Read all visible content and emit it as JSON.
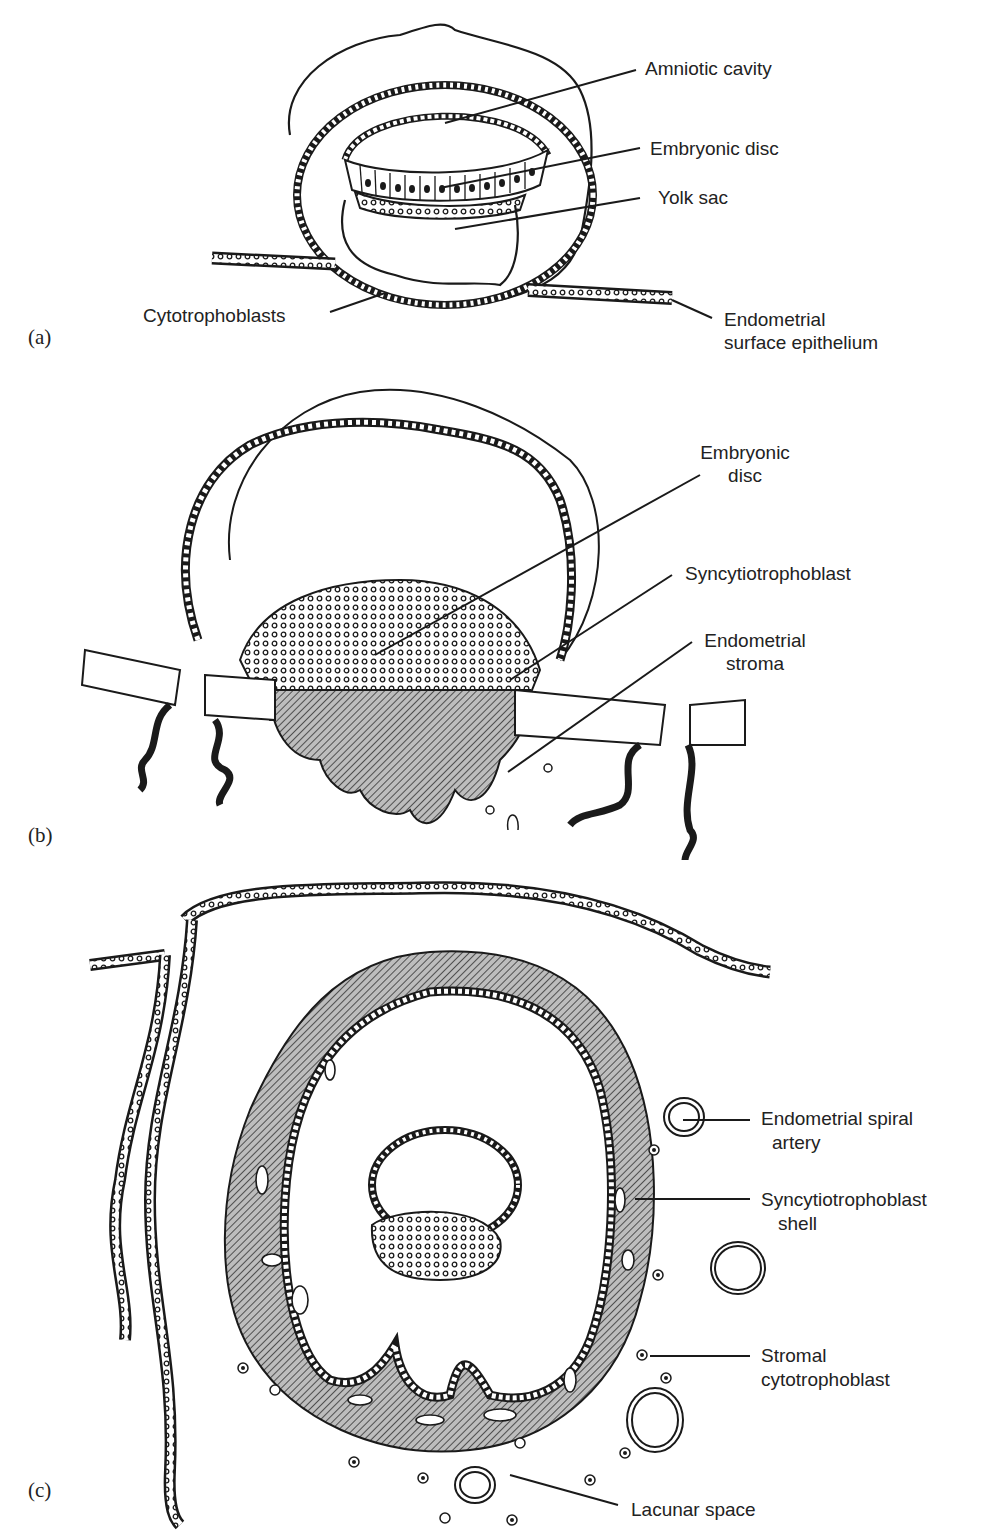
{
  "panels": [
    {
      "id": "a",
      "panel_label": "(a)",
      "labels": {
        "amniotic_cavity": "Amniotic cavity",
        "embryonic_disc": "Embryonic disc",
        "yolk_sac": "Yolk sac",
        "cytotrophoblasts": "Cytotrophoblasts",
        "endometrial_surface_epithelium_1": "Endometrial",
        "endometrial_surface_epithelium_2": "surface epithelium"
      }
    },
    {
      "id": "b",
      "panel_label": "(b)",
      "labels": {
        "embryonic_disc_1": "Embryonic",
        "embryonic_disc_2": "disc",
        "syncytiotrophoblast": "Syncytiotrophoblast",
        "endometrial_stroma_1": "Endometrial",
        "endometrial_stroma_2": "stroma"
      }
    },
    {
      "id": "c",
      "panel_label": "(c)",
      "labels": {
        "spiral_artery_1": "Endometrial spiral",
        "spiral_artery_2": "artery",
        "syncytio_shell_1": "Syncytiotrophoblast",
        "syncytio_shell_2": "shell",
        "stromal_cyto_1": "Stromal",
        "stromal_cyto_2": "cytotrophoblast",
        "lacunar_space": "Lacunar space"
      }
    }
  ],
  "colors": {
    "ink": "#1a1a1a",
    "hatch_fill": "#9a9a9a",
    "background": "#ffffff"
  }
}
